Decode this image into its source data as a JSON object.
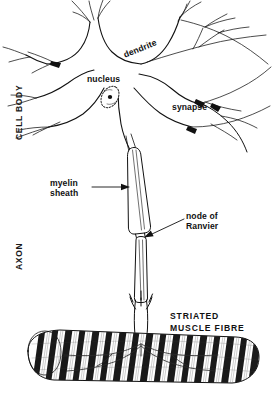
{
  "figure": {
    "background_color": "#ffffff",
    "ink_color": "#111111"
  },
  "region_labels": [
    {
      "name": "cell-body",
      "text": "CELL   BODY",
      "orientation": "vertical-90"
    },
    {
      "name": "axon",
      "text": "AXON",
      "orientation": "vertical-90"
    }
  ],
  "part_labels": {
    "nucleus": "nucleus",
    "dendrite": "dendrite",
    "synapse": "synapse",
    "myelin_sheath_line1": "myelin",
    "myelin_sheath_line2": "sheath",
    "node_of_ranvier_line1": "node   of",
    "node_of_ranvier_line2": "Ranvier",
    "striated_muscle_line1": "STRIATED",
    "striated_muscle_line2": "MUSCLE   FIBRE"
  },
  "structures": {
    "cell_body": "soma with radiating dendrites",
    "nucleus": "ellipse with nucleolus inside soma",
    "axon": "two myelinated internodes separated by a node of Ranvier",
    "axon_terminal": "trident-shaped motor end plate branches",
    "muscle_fibre": "striated cylinder with alternating dark and light bands"
  }
}
